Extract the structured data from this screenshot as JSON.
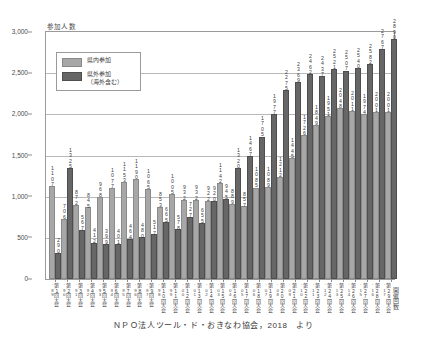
{
  "figure": {
    "axis_title_y": "参加人数",
    "axis_title_x": "開催回数",
    "caption": "ＮＰＯ法人ツール・ド・おきなわ協会，2018　より",
    "top_strip": "",
    "colors": {
      "inner_bar": "#a7a7a7",
      "outer_bar": "#666666",
      "gridline": "#b9b9b9",
      "axis": "#9a9a9a",
      "text": "#3a3a3a"
    }
  },
  "legend": {
    "items": [
      {
        "label": "県内参加",
        "swatch": "inner"
      },
      {
        "label": "県外参加\n（海外含む）",
        "swatch": "outer"
      }
    ]
  },
  "chart_data": {
    "type": "bar",
    "title": "",
    "subtitle": "",
    "xlabel": "開催回数",
    "ylabel": "参加人数",
    "ylim": [
      0,
      3000
    ],
    "yticks": [
      "0",
      "500",
      "1,000",
      "1,500",
      "2,000",
      "2,500",
      "3,000"
    ],
    "ytick_values": [
      0,
      500,
      1000,
      1500,
      2000,
      2500,
      3000
    ],
    "grid": true,
    "legend_position": "inside-top-left",
    "categories": [
      "第1回大会",
      "第2回大会",
      "第3回大会",
      "第4回大会",
      "第5回大会",
      "第6回大会",
      "第7回大会",
      "第8回大会",
      "第9回大会",
      "第10回大会",
      "第11回大会",
      "第12回大会",
      "第13回大会",
      "第14回大会",
      "第15回大会",
      "第16回大会",
      "第17回大会",
      "第18回大会",
      "第19回大会",
      "第20回大会",
      "第21回大会",
      "第22回大会",
      "第23回大会",
      "第24回大会",
      "第25回大会",
      "第26回大会",
      "第27回大会",
      "第28回大会",
      "第29回大会"
    ],
    "category_years": [
      "'89",
      "'90",
      "'91",
      "'92",
      "'93",
      "'94",
      "'95",
      "'96",
      "'97",
      "'98",
      "'99",
      "'00",
      "'01",
      "'02",
      "'03",
      "'04",
      "'05",
      "'06",
      "'07",
      "'08",
      "'09",
      "'10",
      "'11",
      "'12",
      "'13",
      "'14",
      "'15",
      "'16",
      "'17"
    ],
    "series": [
      {
        "name": "県内参加",
        "color": "#a7a7a7",
        "values": [
          1107,
          706,
          872,
          845,
          968,
          1077,
          1153,
          1190,
          1065,
          853,
          1005,
          932,
          932,
          922,
          1142,
          889,
          857,
          1085,
          1089,
          1212,
          1445,
          1726,
          1849,
          1951,
          2048,
          2011,
          1974,
          2001,
          2001
        ]
      },
      {
        "name": "県外参加（海外含む）",
        "color": "#666666",
        "values": [
          290,
          1325,
          567,
          412,
          399,
          401,
          464,
          480,
          517,
          665,
          578,
          727,
          655,
          920,
          945,
          1320,
          1467,
          1705,
          1977,
          2275,
          2369,
          2462,
          2437,
          2521,
          2507,
          2540,
          2582,
          2767,
          2890
        ]
      }
    ],
    "bar_labels": [
      {
        "inner": "1107",
        "outer": "290"
      },
      {
        "inner": "706",
        "outer": "1325"
      },
      {
        "inner": "872",
        "outer": "567"
      },
      {
        "inner": "845",
        "outer": "412"
      },
      {
        "inner": "968",
        "outer": "399"
      },
      {
        "inner": "1077",
        "outer": "401"
      },
      {
        "inner": "1153",
        "outer": "464"
      },
      {
        "inner": "1190",
        "outer": "480"
      },
      {
        "inner": "1065",
        "outer": "517"
      },
      {
        "inner": "853",
        "outer": "665"
      },
      {
        "inner": "1005",
        "outer": "578"
      },
      {
        "inner": "932",
        "outer": "727"
      },
      {
        "inner": "932",
        "outer": "655"
      },
      {
        "inner": "922",
        "outer": "920"
      },
      {
        "inner": "1142",
        "outer": "945"
      },
      {
        "inner": "889",
        "outer": "1320"
      },
      {
        "inner": "857",
        "outer": "1467"
      },
      {
        "inner": "1085",
        "outer": "1705"
      },
      {
        "inner": "1089",
        "outer": "1977"
      },
      {
        "inner": "1212",
        "outer": "2275"
      },
      {
        "inner": "1445",
        "outer": "2369"
      },
      {
        "inner": "1726",
        "outer": "2462"
      },
      {
        "inner": "1849",
        "outer": "2437"
      },
      {
        "inner": "1951",
        "outer": "2521"
      },
      {
        "inner": "2048",
        "outer": "2507"
      },
      {
        "inner": "2011",
        "outer": "2540"
      },
      {
        "inner": "1974",
        "outer": "2582"
      },
      {
        "inner": "2001",
        "outer": "2767"
      },
      {
        "inner": "2001",
        "outer": "2890"
      }
    ]
  }
}
